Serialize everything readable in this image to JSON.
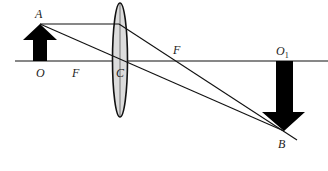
{
  "diagram": {
    "type": "convex-lens-ray-diagram",
    "colors": {
      "background": "#ffffff",
      "stroke": "#111111",
      "arrow_fill": "#000000",
      "lens_fill": "#dcdcdc"
    },
    "labels": {
      "object_tip": "A",
      "object_base": "O",
      "focal_left": "F",
      "lens_center": "C",
      "focal_right": "F",
      "image_base": "O",
      "image_base_subscript": "1",
      "image_tip": "B"
    },
    "elements": {
      "principal_axis": "principal axis",
      "object_arrow": "upright object arrow OA",
      "lens": "convex lens",
      "image_arrow": "inverted image arrow O1B",
      "ray_parallel": "ray parallel to axis refracted through F",
      "ray_center": "ray through optical center C"
    },
    "watermarks": {
      "bottom_left": "",
      "bottom_right": ""
    }
  }
}
